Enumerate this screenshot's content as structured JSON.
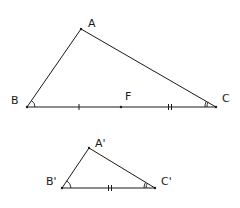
{
  "diagram": {
    "type": "geometry-similar-triangles",
    "triangle_large": {
      "vertices": {
        "A": {
          "label": "A",
          "x": 81,
          "y": 29
        },
        "B": {
          "label": "B",
          "x": 27,
          "y": 107
        },
        "C": {
          "label": "C",
          "x": 216,
          "y": 107
        }
      },
      "point_on_BC": {
        "label": "F",
        "x": 121,
        "y": 107
      },
      "tick_marks": [
        {
          "segment": "BF",
          "count": 1,
          "x": 79
        },
        {
          "segment": "FC",
          "count": 2,
          "x": 170
        }
      ],
      "angle_marks": [
        "B",
        "C"
      ]
    },
    "triangle_small": {
      "vertices": {
        "A_prime": {
          "label": "A'",
          "x": 89,
          "y": 148
        },
        "B_prime": {
          "label": "B'",
          "x": 62,
          "y": 188
        },
        "C_prime": {
          "label": "C'",
          "x": 155,
          "y": 188
        }
      },
      "tick_marks": [
        {
          "segment": "B'C'",
          "count": 2,
          "x": 110
        }
      ],
      "angle_marks": [
        "B'",
        "C'"
      ]
    }
  }
}
